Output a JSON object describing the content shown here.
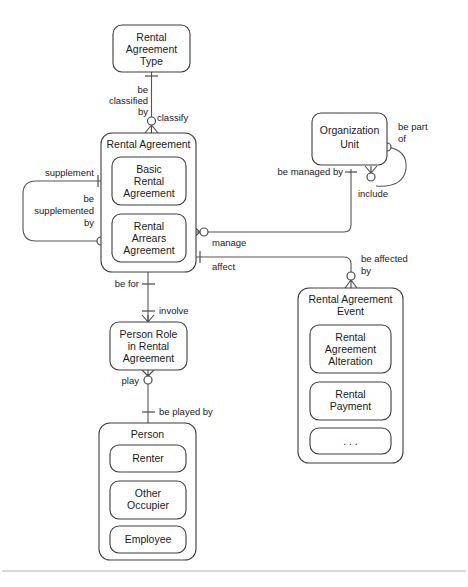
{
  "diagram": {
    "type": "entity-relationship",
    "notation": "crows-foot",
    "background_color": "#ffffff",
    "line_color": "#555555",
    "box_stroke_color": "#3c3c3c",
    "text_color": "#1a1a1a",
    "footer_rule_color": "#b4b4b4"
  },
  "entities": {
    "rental_agreement_type": {
      "name": "rental-agreement-type",
      "label_lines": [
        "Rental",
        "Agreement",
        "Type"
      ],
      "line1": "Rental",
      "line2": "Agreement",
      "line3": "Type",
      "x": 113,
      "y": 25,
      "w": 77,
      "h": 47
    },
    "rental_agreement": {
      "name": "rental-agreement",
      "label": "Rental Agreement",
      "x": 101,
      "y": 133,
      "w": 95,
      "h": 139,
      "subtypes": [
        {
          "name": "basic-rental-agreement",
          "label_lines": [
            "Basic",
            "Rental",
            "Agreement"
          ],
          "line1": "Basic",
          "line2": "Rental",
          "line3": "Agreement",
          "x": 112,
          "y": 157,
          "w": 74,
          "h": 48
        },
        {
          "name": "rental-arrears-agreement",
          "label_lines": [
            "Rental",
            "Arrears",
            "Agreement"
          ],
          "line1": "Rental",
          "line2": "Arrears",
          "line3": "Agreement",
          "x": 112,
          "y": 214,
          "w": 74,
          "h": 48
        }
      ]
    },
    "organization_unit": {
      "name": "organization-unit",
      "label_lines": [
        "Organization",
        "Unit"
      ],
      "line1": "Organization",
      "line2": "Unit",
      "x": 312,
      "y": 113,
      "w": 75,
      "h": 52
    },
    "rental_agreement_event": {
      "name": "rental-agreement-event",
      "label_lines": [
        "Rental Agreement",
        "Event"
      ],
      "line1": "Rental Agreement",
      "line2": "Event",
      "x": 298,
      "y": 288,
      "w": 105,
      "h": 175,
      "subtypes": [
        {
          "name": "rental-agreement-alteration",
          "label_lines": [
            "Rental",
            "Agreement",
            "Alteration"
          ],
          "line1": "Rental",
          "line2": "Agreement",
          "line3": "Alteration",
          "x": 310,
          "y": 325,
          "w": 81,
          "h": 48
        },
        {
          "name": "rental-payment",
          "label_lines": [
            "Rental",
            "Payment"
          ],
          "line1": "Rental",
          "line2": "Payment",
          "x": 310,
          "y": 382,
          "w": 81,
          "h": 38
        },
        {
          "name": "ellipsis-placeholder",
          "label_lines": [
            ". . ."
          ],
          "line1": ". . .",
          "x": 310,
          "y": 428,
          "w": 81,
          "h": 26
        }
      ]
    },
    "person_role_in_rental_agreement": {
      "name": "person-role-in-rental-agreement",
      "label_lines": [
        "Person Role",
        "in Rental",
        "Agreement"
      ],
      "line1": "Person Role",
      "line2": "in Rental",
      "line3": "Agreement",
      "x": 110,
      "y": 322,
      "w": 77,
      "h": 48
    },
    "person": {
      "name": "person",
      "label": "Person",
      "x": 99,
      "y": 423,
      "w": 97,
      "h": 137,
      "subtypes": [
        {
          "name": "renter",
          "label": "Renter",
          "x": 110,
          "y": 445,
          "w": 76,
          "h": 27
        },
        {
          "name": "other-occupier",
          "label_lines": [
            "Other",
            "Occupier"
          ],
          "line1": "Other",
          "line2": "Occupier",
          "x": 110,
          "y": 481,
          "w": 76,
          "h": 38
        },
        {
          "name": "employee",
          "label": "Employee",
          "x": 110,
          "y": 526,
          "w": 76,
          "h": 27
        }
      ]
    }
  },
  "relationships": [
    {
      "name": "classify",
      "from": "rental-agreement-type",
      "to": "rental-agreement",
      "forward_label_lines": [
        "be",
        "classified",
        "by"
      ],
      "forward_l1": "be",
      "forward_l2": "classified",
      "forward_l3": "by",
      "reverse_label": "classify"
    },
    {
      "name": "supplement",
      "from": "basic-rental-agreement",
      "to": "rental-arrears-agreement",
      "forward_label": "supplement",
      "reverse_label_lines": [
        "be",
        "supplemented",
        "by"
      ],
      "reverse_l1": "be",
      "reverse_l2": "supplemented",
      "reverse_l3": "by"
    },
    {
      "name": "manage",
      "from": "organization-unit",
      "to": "rental-agreement",
      "forward_label": "manage",
      "reverse_label": "be managed  by"
    },
    {
      "name": "be-part-of-include",
      "from": "organization-unit",
      "to": "organization-unit",
      "forward_label_lines": [
        "be part",
        "of"
      ],
      "forward_l1": "be part",
      "forward_l2": "of",
      "reverse_label": "include"
    },
    {
      "name": "affect",
      "from": "rental-agreement-event",
      "to": "rental-agreement",
      "forward_label": "affect",
      "reverse_label_lines": [
        "be affected",
        "by"
      ],
      "reverse_l1": "be affected",
      "reverse_l2": "by"
    },
    {
      "name": "involve",
      "from": "rental-agreement",
      "to": "person-role-in-rental-agreement",
      "forward_label": "be for",
      "reverse_label": "involve"
    },
    {
      "name": "play",
      "from": "person",
      "to": "person-role-in-rental-agreement",
      "forward_label": "play",
      "reverse_label": "be played by"
    }
  ]
}
